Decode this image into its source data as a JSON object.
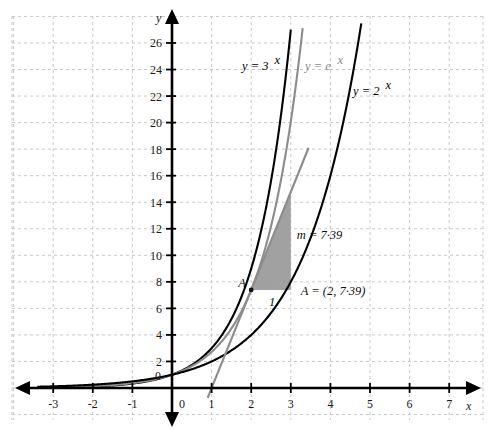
{
  "chart_data": {
    "type": "line",
    "title": "",
    "xlabel": "x",
    "ylabel": "y",
    "xlim": [
      -3.6,
      7.8
    ],
    "ylim": [
      -1.6,
      27.6
    ],
    "grid": true,
    "grid_style": "dashed",
    "grid_color": "#c9c9c9",
    "x_ticks": [
      -3,
      -2,
      -1,
      0,
      1,
      2,
      3,
      4,
      5,
      6,
      7
    ],
    "x_tick_labels": [
      "-3",
      "-2",
      "-1",
      "0",
      "1",
      "2",
      "3",
      "4",
      "5",
      "6",
      "7"
    ],
    "y_ticks": [
      0,
      2,
      4,
      6,
      8,
      10,
      12,
      14,
      16,
      18,
      20,
      22,
      24,
      26
    ],
    "y_tick_labels": [
      "0",
      "2",
      "4",
      "6",
      "8",
      "10",
      "12",
      "14",
      "16",
      "18",
      "20",
      "22",
      "24",
      "26"
    ],
    "legend": "inline-labels",
    "series": [
      {
        "name": "y = 3^x",
        "label": "y = 3",
        "exponent": "x",
        "color": "#000000",
        "base": 3,
        "domain": [
          -3.4,
          3.0
        ],
        "style": "solid"
      },
      {
        "name": "y = e^x",
        "label": "y = e",
        "exponent": "x",
        "color": "#8c8c8c",
        "base": 2.71828,
        "domain": [
          -3.4,
          3.3
        ],
        "style": "solid"
      },
      {
        "name": "y = 2^x",
        "label": "y = 2",
        "exponent": "x",
        "color": "#000000",
        "base": 2,
        "domain": [
          -3.4,
          4.78
        ],
        "style": "solid"
      }
    ],
    "tangent_line": {
      "name": "tangent-to-exp-at-A",
      "color": "#8c8c8c",
      "slope": 7.39,
      "through_point": [
        2,
        7.39
      ],
      "x_intercept": 1,
      "domain": [
        0.9,
        3.45
      ]
    },
    "shaded_triangle": {
      "name": "gradient-triangle",
      "fill": "#9a9a9a",
      "vertices": [
        [
          2,
          7.39
        ],
        [
          3,
          7.39
        ],
        [
          3,
          14.78
        ]
      ],
      "run_label": "1",
      "rise_label": "m = 7·39"
    },
    "annotations": [
      {
        "name": "point-A-marker",
        "text": "A",
        "x": 2,
        "y": 7.39
      },
      {
        "name": "point-A-coordinates",
        "text": "A = (2, 7·39)",
        "x": 3.25,
        "y": 7.0
      },
      {
        "name": "gradient-value",
        "text": "m = 7·39",
        "x": 3.15,
        "y": 11.2
      },
      {
        "name": "run-label",
        "text": "1",
        "x": 2.45,
        "y": 6.2
      }
    ]
  },
  "axes": {
    "x_axis_label": "x",
    "y_axis_label": "y",
    "origin_label": "0",
    "y_zero_label": "0"
  }
}
